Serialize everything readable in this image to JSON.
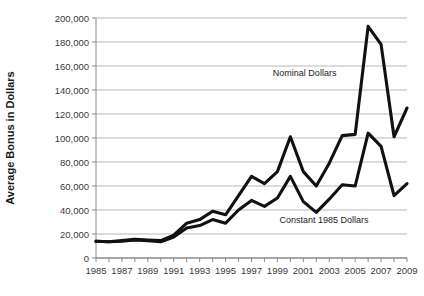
{
  "chart_data": {
    "type": "line",
    "title": "",
    "xlabel": "",
    "ylabel": "Average Bonus in Dollars",
    "xlim": [
      1985,
      2009
    ],
    "ylim": [
      0,
      200000
    ],
    "grid": true,
    "legend_position": "inline-annotation",
    "x": [
      1985,
      1986,
      1987,
      1988,
      1989,
      1990,
      1991,
      1992,
      1993,
      1994,
      1995,
      1996,
      1997,
      1998,
      1999,
      2000,
      2001,
      2002,
      2003,
      2004,
      2005,
      2006,
      2007,
      2008,
      2009
    ],
    "y_ticks": [
      0,
      20000,
      40000,
      60000,
      80000,
      100000,
      120000,
      140000,
      160000,
      180000,
      200000
    ],
    "y_tick_labels": [
      "0",
      "20,000",
      "40,000",
      "60,000",
      "80,000",
      "100,000",
      "120,000",
      "140,000",
      "160,000",
      "180,000",
      "200,000"
    ],
    "x_ticks": [
      1985,
      1986,
      1987,
      1988,
      1989,
      1990,
      1991,
      1992,
      1993,
      1994,
      1995,
      1996,
      1997,
      1998,
      1999,
      2000,
      2001,
      2002,
      2003,
      2004,
      2005,
      2006,
      2007,
      2008,
      2009
    ],
    "x_tick_labels": [
      "1985",
      "",
      "1987",
      "",
      "1989",
      "",
      "1991",
      "",
      "1993",
      "",
      "1995",
      "",
      "1997",
      "",
      "1999",
      "",
      "2001",
      "",
      "2003",
      "",
      "2005",
      "",
      "2007",
      "",
      "2009"
    ],
    "series": [
      {
        "name": "Nominal Dollars",
        "color": "#111111",
        "values": [
          14000,
          13500,
          14500,
          15500,
          15000,
          14500,
          19000,
          29000,
          32000,
          39000,
          36000,
          52000,
          68000,
          62000,
          72000,
          101000,
          72000,
          60000,
          79000,
          102000,
          103000,
          193000,
          178000,
          101000,
          125000
        ]
      },
      {
        "name": "Constant 1985 Dollars",
        "color": "#111111",
        "values": [
          14000,
          13500,
          14000,
          15000,
          14500,
          13500,
          17500,
          25000,
          27000,
          32000,
          29000,
          40000,
          48000,
          43000,
          50000,
          68000,
          47000,
          38000,
          49000,
          61000,
          60000,
          104000,
          93000,
          52000,
          62000
        ]
      }
    ],
    "annotations": [
      {
        "name": "nominal-dollars-label",
        "text": "Nominal Dollars",
        "x": 2001.1,
        "y": 152000
      },
      {
        "name": "constant-1985-dollars-label",
        "text": "Constant 1985 Dollars",
        "x": 2002.6,
        "y": 29000
      }
    ],
    "colors": {
      "line": "#111111",
      "grid": "#b8b8b8",
      "axis": "#8a8a8a",
      "text": "#2b2b2b"
    }
  }
}
